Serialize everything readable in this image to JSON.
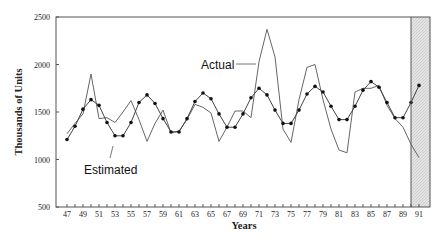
{
  "chart_data": {
    "type": "line",
    "title": "",
    "xlabel": "Years",
    "ylabel": "Thousands of Units",
    "ylim": [
      500,
      2500
    ],
    "xlim": [
      46,
      92.4
    ],
    "yticks": [
      500,
      1000,
      1500,
      2000,
      2500
    ],
    "xticks": [
      47,
      49,
      51,
      53,
      55,
      57,
      59,
      61,
      63,
      65,
      67,
      69,
      71,
      73,
      75,
      77,
      79,
      81,
      83,
      85,
      87,
      89,
      91
    ],
    "grid": false,
    "legend": "inline annotations",
    "x": [
      47,
      48,
      49,
      50,
      51,
      52,
      53,
      54,
      55,
      56,
      57,
      58,
      59,
      60,
      61,
      62,
      63,
      64,
      65,
      66,
      67,
      68,
      69,
      70,
      71,
      72,
      73,
      74,
      75,
      76,
      77,
      78,
      79,
      80,
      81,
      82,
      83,
      84,
      85,
      86,
      87,
      88,
      89,
      90,
      91
    ],
    "series": [
      {
        "name": "Actual",
        "marker": "none",
        "values": [
          1270,
          1380,
          1480,
          1900,
          1430,
          1440,
          1390,
          1500,
          1620,
          1420,
          1190,
          1380,
          1520,
          1280,
          1300,
          1420,
          1580,
          1550,
          1490,
          1190,
          1340,
          1510,
          1510,
          1440,
          2030,
          2370,
          2080,
          1320,
          1180,
          1630,
          1970,
          2000,
          1630,
          1320,
          1100,
          1070,
          1710,
          1750,
          1750,
          1780,
          1570,
          1430,
          1340,
          1160,
          1020
        ]
      },
      {
        "name": "Estimated",
        "marker": "dot",
        "values": [
          1210,
          1350,
          1530,
          1630,
          1570,
          1390,
          1250,
          1250,
          1390,
          1600,
          1680,
          1590,
          1430,
          1290,
          1290,
          1430,
          1610,
          1700,
          1640,
          1480,
          1340,
          1340,
          1480,
          1650,
          1750,
          1680,
          1520,
          1380,
          1380,
          1520,
          1690,
          1770,
          1710,
          1560,
          1420,
          1420,
          1560,
          1730,
          1820,
          1760,
          1600,
          1440,
          1440,
          1600,
          1780
        ]
      }
    ],
    "annotations": [
      {
        "text": "Actual",
        "points_to": "Actual"
      },
      {
        "text": "Estimated",
        "points_to": "Estimated"
      }
    ],
    "shaded_region": {
      "x_from": 90,
      "x_to": 92.4,
      "pattern": "hatched"
    }
  },
  "labels": {
    "xlabel": "Years",
    "ylabel": "Thousands of Units",
    "actual_annotation": "Actual",
    "estimated_annotation": "Estimated"
  }
}
